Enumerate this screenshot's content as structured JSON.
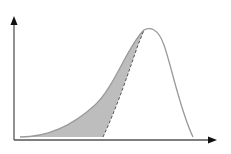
{
  "diagram": {
    "type": "skewed-distribution-curve",
    "colors": {
      "axis": "#555555",
      "curve": "#9a9a9a",
      "shade": "#bdbdbd",
      "dashed": "#555555",
      "background": "#ffffff"
    },
    "axes": {
      "origin": [
        14,
        140
      ],
      "y_arrow_tip": [
        14,
        16
      ],
      "x_arrow_tip": [
        217,
        140
      ]
    },
    "curve": {
      "start": [
        20,
        137
      ],
      "peak": [
        146,
        30
      ],
      "end": [
        193,
        137
      ]
    },
    "dashed_line": {
      "from": [
        103,
        137
      ],
      "to": [
        144,
        30
      ]
    },
    "labels": []
  }
}
